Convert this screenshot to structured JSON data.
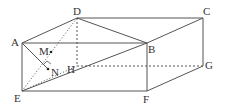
{
  "figure": {
    "type": "geometry-diagram",
    "stroke_color": "#555555",
    "label_color": "#333333",
    "vertices": [
      {
        "id": "A",
        "label": "A",
        "x": 22,
        "y": 43,
        "lx": 11,
        "ly": 46
      },
      {
        "id": "B",
        "label": "B",
        "x": 147,
        "y": 43,
        "lx": 148,
        "ly": 53
      },
      {
        "id": "C",
        "label": "C",
        "x": 203,
        "y": 18,
        "lx": 203,
        "ly": 15
      },
      {
        "id": "D",
        "label": "D",
        "x": 77,
        "y": 18,
        "lx": 73,
        "ly": 15
      },
      {
        "id": "E",
        "label": "E",
        "x": 22,
        "y": 91,
        "lx": 14,
        "ly": 102
      },
      {
        "id": "F",
        "label": "F",
        "x": 147,
        "y": 91,
        "lx": 143,
        "ly": 103
      },
      {
        "id": "G",
        "label": "G",
        "x": 203,
        "y": 66,
        "lx": 205,
        "ly": 69
      },
      {
        "id": "H",
        "label": "H",
        "x": 77,
        "y": 66,
        "lx": 67,
        "ly": 73
      },
      {
        "id": "M",
        "label": "M",
        "x": 51,
        "y": 52,
        "lx": 39,
        "ly": 55
      },
      {
        "id": "N",
        "label": "N",
        "x": 48,
        "y": 69,
        "lx": 51,
        "ly": 76
      }
    ],
    "edges": [
      {
        "from": "A",
        "to": "B",
        "style": "solid"
      },
      {
        "from": "D",
        "to": "C",
        "style": "solid"
      },
      {
        "from": "A",
        "to": "D",
        "style": "solid"
      },
      {
        "from": "B",
        "to": "C",
        "style": "solid"
      },
      {
        "from": "D",
        "to": "B",
        "style": "solid"
      },
      {
        "from": "A",
        "to": "E",
        "style": "solid"
      },
      {
        "from": "B",
        "to": "F",
        "style": "solid"
      },
      {
        "from": "C",
        "to": "G",
        "style": "solid"
      },
      {
        "from": "E",
        "to": "F",
        "style": "solid"
      },
      {
        "from": "F",
        "to": "G",
        "style": "solid"
      },
      {
        "from": "E",
        "to": "B",
        "style": "solid"
      },
      {
        "from": "A",
        "to": "N",
        "style": "solid"
      },
      {
        "from": "D",
        "to": "H",
        "style": "dashed"
      },
      {
        "from": "H",
        "to": "G",
        "style": "dashed"
      },
      {
        "from": "E",
        "to": "H",
        "style": "dotted"
      },
      {
        "from": "E",
        "to": "D",
        "style": "dotted"
      }
    ],
    "points": [
      "M",
      "N"
    ],
    "right_angle_at": "N"
  }
}
